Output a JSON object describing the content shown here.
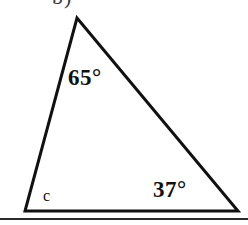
{
  "figure": {
    "kind": "triangle-angle-diagram",
    "background_color": "#ffffff",
    "stroke_color": "#111111",
    "cropped_header_text": "b)",
    "labels": {
      "apex_angle": "65°",
      "right_angle": "37°",
      "left_angle": "c"
    },
    "geometry": {
      "apex": "77,18",
      "bottom_left": "25,211",
      "bottom_right": "238,211",
      "points": "77,18 238,211 25,211"
    },
    "divider": {
      "color": "#2b2b2b"
    }
  }
}
